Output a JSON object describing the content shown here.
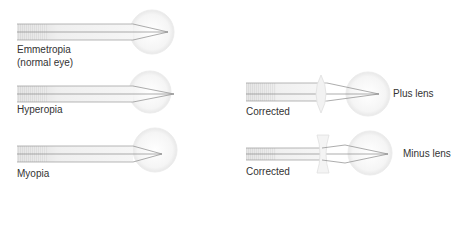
{
  "colors": {
    "background": "#ffffff",
    "ray": "#8a8a8a",
    "beam_fill": "#e4e4e4",
    "eye_fill": "#f4f4f4",
    "eye_stroke": "#e6e6e6",
    "text": "#333333"
  },
  "panels": [
    {
      "id": "emmetropia",
      "label_line1": "Emmetropia",
      "label_line2": "(normal eye)",
      "focus": "on retina"
    },
    {
      "id": "hyperopia",
      "label_line1": "Hyperopia",
      "focus": "behind retina"
    },
    {
      "id": "myopia",
      "label_line1": "Myopia",
      "focus": "in front of retina"
    },
    {
      "id": "hyperopia-corrected",
      "label_line1": "Corrected",
      "lens_label": "Plus lens",
      "lens_type": "convex"
    },
    {
      "id": "myopia-corrected",
      "label_line1": "Corrected",
      "lens_label": "Minus lens",
      "lens_type": "concave"
    }
  ]
}
